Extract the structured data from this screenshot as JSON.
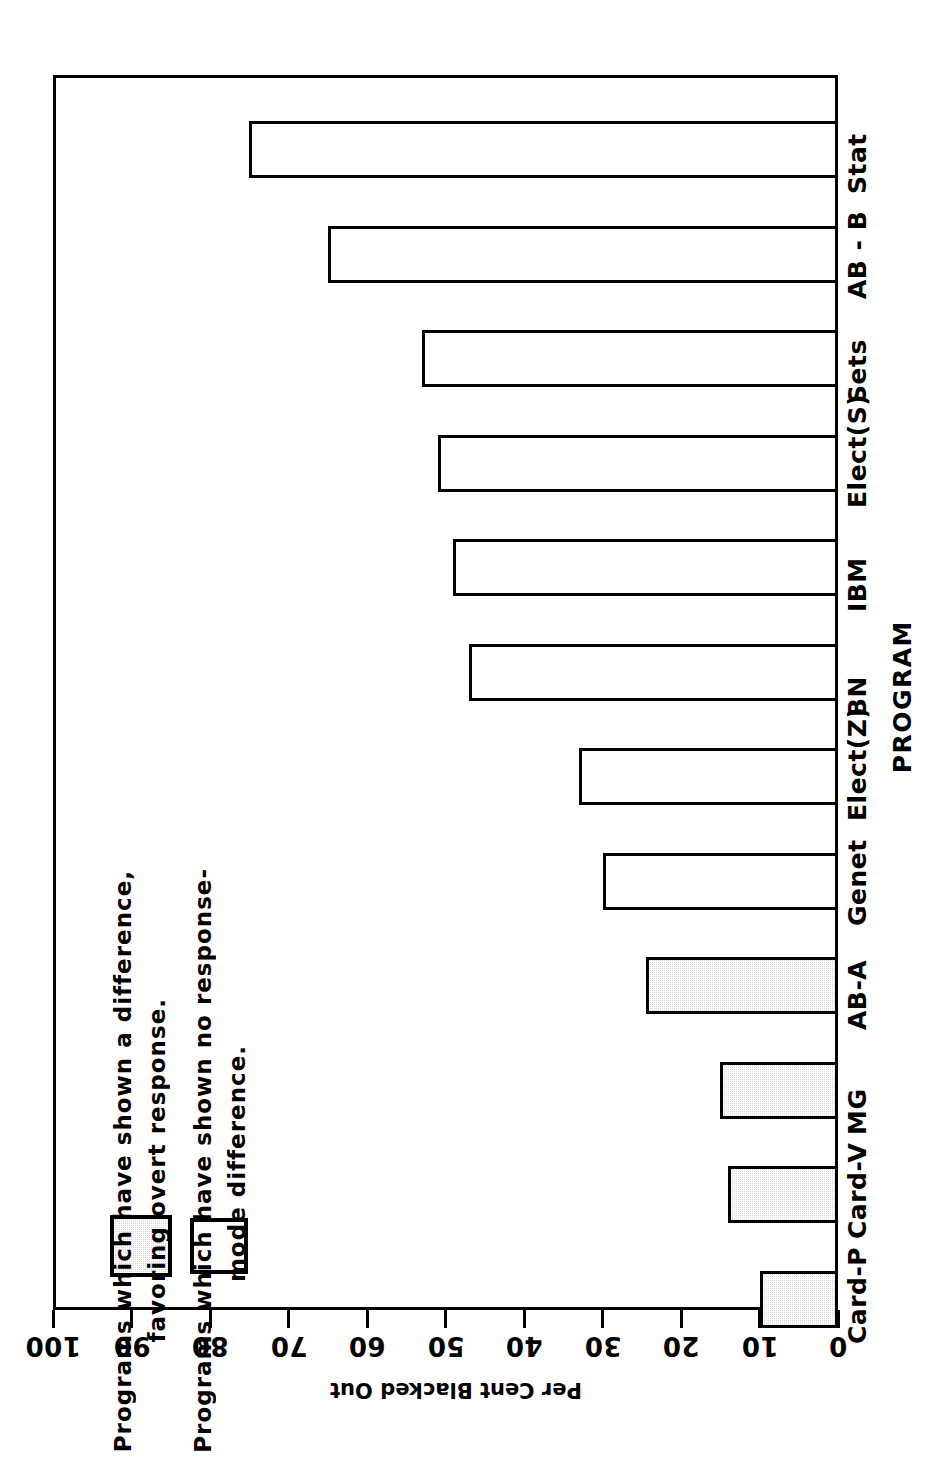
{
  "chart_data": {
    "type": "bar",
    "orientation": "horizontal",
    "title": "",
    "xlabel": "Per Cent Blacked Out",
    "ylabel": "PROGRAM",
    "xlim": [
      0,
      100
    ],
    "xticks": [
      0,
      10,
      20,
      30,
      40,
      50,
      60,
      70,
      80,
      90,
      100
    ],
    "xtick_labels": [
      "0",
      "10",
      "20",
      "30",
      "40",
      "50",
      "60",
      "70",
      "80",
      "90",
      "100"
    ],
    "grid": false,
    "rotated_180": true,
    "categories": [
      "Card-P",
      "Card-V",
      "MG",
      "AB-A",
      "Genet",
      "Elect(Z)",
      "BN",
      "IBM",
      "Elect(S)",
      "Sets",
      "AB - B",
      "Stat"
    ],
    "values": [
      10,
      14,
      15,
      24.5,
      30,
      33,
      47,
      49,
      51,
      53,
      65,
      75
    ],
    "fills": [
      "shaded",
      "shaded",
      "shaded",
      "shaded",
      "open",
      "open",
      "open",
      "open",
      "open",
      "open",
      "open",
      "open"
    ],
    "legend": {
      "position": "inside-left",
      "entries": [
        {
          "swatch": "shaded",
          "line1": "Programs which have shown a  difference,",
          "line2": "favoring overt response."
        },
        {
          "swatch": "open",
          "line1": "Programs which have shown no response-",
          "line2": "mode difference."
        }
      ]
    },
    "colors": {
      "axis": "#000000",
      "bar_outline": "#000000",
      "bar_open_fill": "#ffffff",
      "bar_shaded_fill": "#d9d9d9",
      "background": "#ffffff"
    }
  }
}
